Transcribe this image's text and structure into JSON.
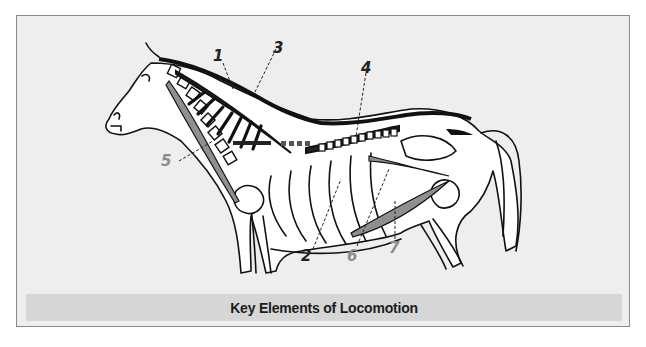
{
  "figure": {
    "caption": "Key Elements of Locomotion",
    "colors": {
      "background": "#eeeeee",
      "frame_border": "#8a8a8a",
      "caption_bar": "#d6d6d6",
      "outline": "#111111",
      "label_dark": "#222222",
      "label_gray": "#8c8c8c",
      "muscle_gray": "#8f8f8f"
    },
    "labels": [
      {
        "id": "1",
        "text": "1",
        "tone": "dark"
      },
      {
        "id": "2",
        "text": "2",
        "tone": "dark"
      },
      {
        "id": "3",
        "text": "3",
        "tone": "dark"
      },
      {
        "id": "4",
        "text": "4",
        "tone": "dark"
      },
      {
        "id": "5",
        "text": "5",
        "tone": "gray"
      },
      {
        "id": "6",
        "text": "6",
        "tone": "gray"
      },
      {
        "id": "7",
        "text": "7",
        "tone": "gray"
      }
    ]
  }
}
